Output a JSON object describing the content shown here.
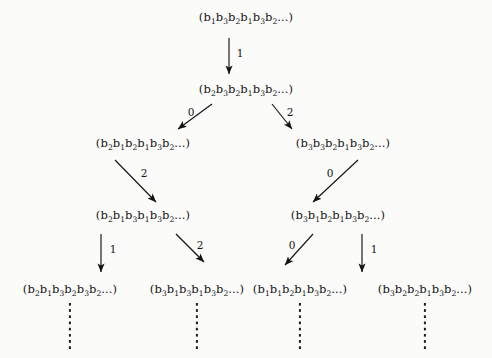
{
  "figure": {
    "type": "tree-diagram",
    "background_color": "#fbfbfa",
    "ink_color": "#141414",
    "levels": 5,
    "nodes": [
      {
        "id": "n0",
        "level": 0,
        "x": 246,
        "y": 18,
        "text": "(b1b3b2b1b3b2...)"
      },
      {
        "id": "n1",
        "level": 1,
        "x": 246,
        "y": 90,
        "text": "(b2b3b2b1b3b2...)"
      },
      {
        "id": "n2L",
        "level": 2,
        "x": 143,
        "y": 144,
        "text": "(b2b1b2b1b3b2...)"
      },
      {
        "id": "n2R",
        "level": 2,
        "x": 343,
        "y": 144,
        "text": "(b3b3b2b1b3b2...)"
      },
      {
        "id": "n3L",
        "level": 3,
        "x": 143,
        "y": 216,
        "text": "(b2b1b3b1b3b2...)"
      },
      {
        "id": "n3R",
        "level": 3,
        "x": 338,
        "y": 216,
        "text": "(b3b1b2b1b3b2...)"
      },
      {
        "id": "n4a",
        "level": 4,
        "x": 70,
        "y": 290,
        "text": "(b2b1b3b2b3b2...)"
      },
      {
        "id": "n4b",
        "level": 4,
        "x": 197,
        "y": 290,
        "text": "(b3b1b3b1b3b2...)"
      },
      {
        "id": "n4c",
        "level": 4,
        "x": 300,
        "y": 290,
        "text": "(b1b1b2b1b3b2...)"
      },
      {
        "id": "n4d",
        "level": 4,
        "x": 425,
        "y": 290,
        "text": "(b3b2b2b1b3b2...)"
      }
    ],
    "edges": [
      {
        "id": "e0",
        "from": "n0",
        "to": "n1",
        "label": "1",
        "x1": 229,
        "y1": 38,
        "x2": 229,
        "y2": 74,
        "lx": 240,
        "ly": 53
      },
      {
        "id": "e1",
        "from": "n1",
        "to": "n2L",
        "label": "0",
        "x1": 212,
        "y1": 104,
        "x2": 178,
        "y2": 129,
        "lx": 191,
        "ly": 112
      },
      {
        "id": "e2",
        "from": "n1",
        "to": "n2R",
        "label": "2",
        "x1": 272,
        "y1": 104,
        "x2": 292,
        "y2": 129,
        "lx": 290,
        "ly": 112
      },
      {
        "id": "e3",
        "from": "n2L",
        "to": "n3L",
        "label": "2",
        "x1": 115,
        "y1": 160,
        "x2": 156,
        "y2": 202,
        "lx": 144,
        "ly": 173
      },
      {
        "id": "e4",
        "from": "n2R",
        "to": "n3R",
        "label": "0",
        "x1": 358,
        "y1": 160,
        "x2": 313,
        "y2": 202,
        "lx": 330,
        "ly": 173
      },
      {
        "id": "e5",
        "from": "n3L",
        "to": "n4a",
        "label": "1",
        "x1": 101,
        "y1": 234,
        "x2": 101,
        "y2": 272,
        "lx": 113,
        "ly": 249
      },
      {
        "id": "e6",
        "from": "n3L",
        "to": "n4b",
        "label": "2",
        "x1": 176,
        "y1": 234,
        "x2": 204,
        "y2": 262,
        "lx": 200,
        "ly": 245
      },
      {
        "id": "e7",
        "from": "n3R",
        "to": "n4c",
        "label": "0",
        "x1": 313,
        "y1": 234,
        "x2": 285,
        "y2": 265,
        "lx": 292,
        "ly": 245
      },
      {
        "id": "e8",
        "from": "n3R",
        "to": "n4d",
        "label": "1",
        "x1": 362,
        "y1": 234,
        "x2": 362,
        "y2": 272,
        "lx": 374,
        "ly": 249
      }
    ],
    "continuations": [
      {
        "id": "d1",
        "x": 70,
        "y": 303,
        "height": 46
      },
      {
        "id": "d2",
        "x": 197,
        "y": 303,
        "height": 46
      },
      {
        "id": "d3",
        "x": 300,
        "y": 303,
        "height": 46
      },
      {
        "id": "d4",
        "x": 425,
        "y": 303,
        "height": 46
      }
    ]
  }
}
